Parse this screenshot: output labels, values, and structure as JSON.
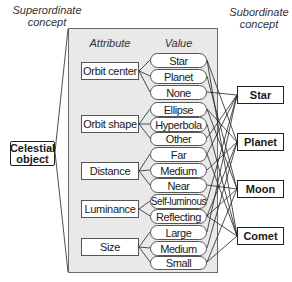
{
  "headings": {
    "superordinate": "Superordinate concept",
    "superordinate_l1": "Superordinate",
    "superordinate_l2": "concept",
    "subordinate_l1": "Subordinate",
    "subordinate_l2": "concept",
    "attribute": "Attribute",
    "value": "Value"
  },
  "root": {
    "l1": "Celestial",
    "l2": "object"
  },
  "attributes": [
    {
      "label": "Orbit center",
      "values": [
        "Star",
        "Planet",
        "None"
      ]
    },
    {
      "label": "Orbit shape",
      "values": [
        "Ellipse",
        "Hyperbola",
        "Other"
      ]
    },
    {
      "label": "Distance",
      "values": [
        "Far",
        "Medium",
        "Near"
      ]
    },
    {
      "label": "Luminance",
      "values": [
        "Self-luminous",
        "Reflecting"
      ]
    },
    {
      "label": "Size",
      "values": [
        "Large",
        "Medium",
        "Small"
      ]
    }
  ],
  "subordinates": [
    "Star",
    "Planet",
    "Moon",
    "Comet"
  ],
  "colors": {
    "panel": "#e9e9e9",
    "line": "#222222",
    "border": "#555555"
  }
}
